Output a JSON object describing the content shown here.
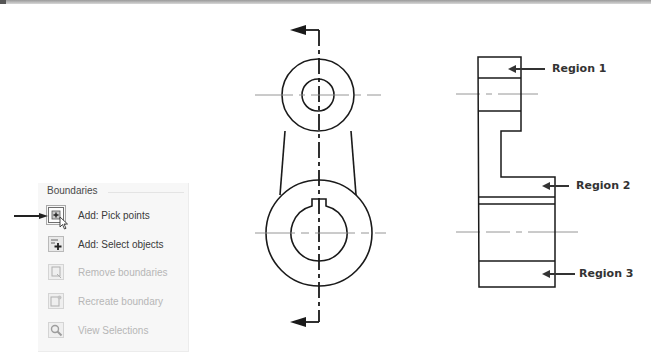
{
  "panel": {
    "title": "Boundaries",
    "items": [
      {
        "label": "Add: Pick points",
        "icon": "pick-points-icon",
        "enabled": true,
        "active": true
      },
      {
        "label": "Add: Select objects",
        "icon": "select-objects-icon",
        "enabled": true,
        "active": false
      },
      {
        "label": "Remove boundaries",
        "icon": "remove-boundaries-icon",
        "enabled": false,
        "active": false
      },
      {
        "label": "Recreate boundary",
        "icon": "recreate-boundary-icon",
        "enabled": false,
        "active": false
      },
      {
        "label": "View Selections",
        "icon": "view-selections-icon",
        "enabled": false,
        "active": false
      }
    ]
  },
  "drawing": {
    "front_view": "lever with two bosses and cutting-plane line",
    "section_view": "stepped profile split into regions"
  },
  "regions": [
    {
      "label": "Region 1"
    },
    {
      "label": "Region 2"
    },
    {
      "label": "Region 3"
    }
  ],
  "colors": {
    "line": "#1a1a1a",
    "centerline": "#8a8a8a",
    "callout": "#333333"
  }
}
